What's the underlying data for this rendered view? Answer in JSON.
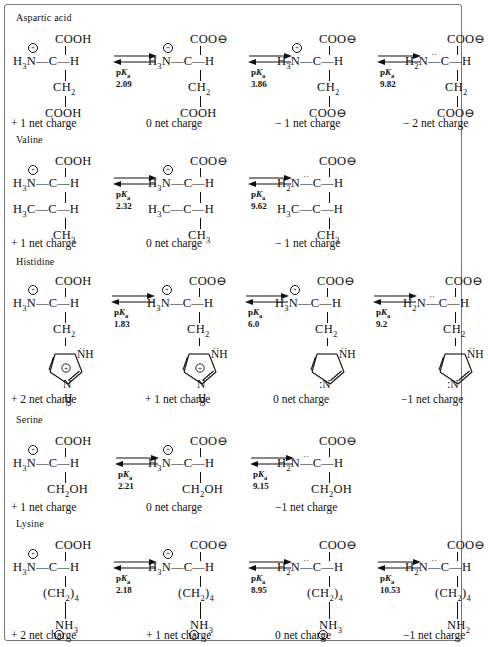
{
  "figure": {
    "type": "chemistry-diagram",
    "labels": {
      "pka_prefix": "p",
      "pka_italic": "K",
      "pka_sub": "a"
    }
  },
  "sections": [
    {
      "name": "Aspartic acid",
      "states": [
        {
          "top": "COOH",
          "amino": "H<sub>3</sub>N",
          "amino_charge": "⊕",
          "alpha": "C",
          "alpha_h": "H",
          "side1": "CH<sub>2</sub>",
          "side2": "COOH",
          "caption": "+ 1 net charge"
        },
        {
          "top": "COO⊖",
          "amino": "H<sub>3</sub>N",
          "amino_charge": "⊕",
          "alpha": "C",
          "alpha_h": "H",
          "side1": "CH<sub>2</sub>",
          "side2": "COOH",
          "caption": "0 net charge"
        },
        {
          "top": "COO⊖",
          "amino": "H<sub>3</sub>N",
          "amino_charge": "⊕",
          "alpha": "C",
          "alpha_h": "H",
          "side1": "CH<sub>2</sub>",
          "side2": "COO⊖",
          "caption": "− 1 net charge"
        },
        {
          "top": "COO⊖",
          "amino": "H<sub>2</sub>N",
          "amino_charge": "¨",
          "alpha": "C",
          "alpha_h": "H",
          "side1": "CH<sub>2</sub>",
          "side2": "COO⊖",
          "caption": "− 2 net charge"
        }
      ],
      "pka": [
        "2.09",
        "3.86",
        "9.82"
      ]
    },
    {
      "name": "Valine",
      "states": [
        {
          "top": "COOH",
          "amino": "H<sub>3</sub>N",
          "amino_charge": "⊕",
          "alpha": "C",
          "alpha_h": "H",
          "side1": "H<sub>3</sub>C—C—H",
          "side2": "CH<sub>3</sub>",
          "caption": "+ 1 net charge"
        },
        {
          "top": "COO⊖",
          "amino": "H<sub>3</sub>N",
          "amino_charge": "⊕",
          "alpha": "C",
          "alpha_h": "H",
          "side1": "H<sub>3</sub>C—C—H",
          "side2": "CH<sub>3</sub>",
          "caption": "0 net charge"
        },
        {
          "top": "COO⊖",
          "amino": "H<sub>2</sub>N",
          "amino_charge": "¨",
          "alpha": "C",
          "alpha_h": "H",
          "side1": "H<sub>3</sub>C—C—H",
          "side2": "CH<sub>3</sub>",
          "caption": "− 1 net charge"
        }
      ],
      "pka": [
        "2.32",
        "9.62"
      ]
    },
    {
      "name": "Histidine",
      "states": [
        {
          "top": "COOH",
          "amino": "H<sub>3</sub>N",
          "amino_charge": "⊕",
          "alpha": "C",
          "alpha_h": "H",
          "side1": "CH<sub>2</sub>",
          "ring": "imidazolium",
          "ring_n1": "NH",
          "ring_n3": "N",
          "ring_n3_h": "H",
          "ring_charge": "⊕",
          "caption": "+ 2 net charge"
        },
        {
          "top": "COO⊖",
          "amino": "H<sub>3</sub>N",
          "amino_charge": "⊕",
          "alpha": "C",
          "alpha_h": "H",
          "side1": "CH<sub>2</sub>",
          "ring": "imidazolium",
          "ring_n1": "NH",
          "ring_n3": "N",
          "ring_n3_h": "H",
          "ring_charge": "⊕",
          "caption": "+ 1 net charge"
        },
        {
          "top": "COO⊖",
          "amino": "H<sub>3</sub>N",
          "amino_charge": "⊕",
          "alpha": "C",
          "alpha_h": "H",
          "side1": "CH<sub>2</sub>",
          "ring": "imidazole",
          "ring_n1": "NH",
          "ring_n3": "N",
          "ring_n3_h": "",
          "ring_charge": "",
          "caption": "0 net charge"
        },
        {
          "top": "COO⊖",
          "amino": "H<sub>2</sub>N",
          "amino_charge": "¨",
          "alpha": "C",
          "alpha_h": "H",
          "side1": "CH<sub>2</sub>",
          "ring": "imidazole",
          "ring_n1": "NH",
          "ring_n3": "N",
          "ring_n3_h": "",
          "ring_charge": "",
          "caption": "−1 net charge"
        }
      ],
      "pka": [
        "1.83",
        "6.0",
        "9.2"
      ]
    },
    {
      "name": "Serine",
      "states": [
        {
          "top": "COOH",
          "amino": "H<sub>3</sub>N",
          "amino_charge": "⊕",
          "alpha": "C",
          "alpha_h": "H",
          "side1": "CH<sub>2</sub>OH",
          "side2": "",
          "caption": "+ 1 net charge"
        },
        {
          "top": "COO⊖",
          "amino": "H<sub>3</sub>N",
          "amino_charge": "⊕",
          "alpha": "C",
          "alpha_h": "H",
          "side1": "CH<sub>2</sub>OH",
          "side2": "",
          "caption": "0 net charge"
        },
        {
          "top": "COO⊖",
          "amino": "H<sub>2</sub>N",
          "amino_charge": "¨",
          "alpha": "C",
          "alpha_h": "H",
          "side1": "CH<sub>2</sub>OH",
          "side2": "",
          "caption": "−1 net charge"
        }
      ],
      "pka": [
        "2.21",
        "9.15"
      ]
    },
    {
      "name": "Lysine",
      "states": [
        {
          "top": "COOH",
          "amino": "H<sub>3</sub>N",
          "amino_charge": "⊕",
          "alpha": "C",
          "alpha_h": "H",
          "side1": "(CH<sub>2</sub>)<sub>4</sub>",
          "side2": "NH<sub>3</sub>",
          "side2_charge": "⊕",
          "caption": "+ 2 net charge"
        },
        {
          "top": "COO⊖",
          "amino": "H<sub>3</sub>N",
          "amino_charge": "⊕",
          "alpha": "C",
          "alpha_h": "H",
          "side1": "(CH<sub>2</sub>)<sub>4</sub>",
          "side2": "NH<sub>3</sub>",
          "side2_charge": "⊕",
          "caption": "+ 1 net charge"
        },
        {
          "top": "COO⊖",
          "amino": "H<sub>2</sub>N",
          "amino_charge": "¨",
          "alpha": "C",
          "alpha_h": "H",
          "side1": "(CH<sub>2</sub>)<sub>4</sub>",
          "side2": "NH<sub>3</sub>",
          "side2_charge": "⊕",
          "caption": "0 net charge"
        },
        {
          "top": "COO⊖",
          "amino": "H<sub>2</sub>N",
          "amino_charge": "¨",
          "alpha": "C",
          "alpha_h": "H",
          "side1": "(CH<sub>2</sub>)<sub>4</sub>",
          "side2": "NH<sub>2</sub>",
          "side2_charge": "¨",
          "caption": "−1 net charge"
        }
      ],
      "pka": [
        "2.18",
        "8.95",
        "10.53"
      ]
    }
  ],
  "colors": {
    "ink": "#111111",
    "border": "#777777",
    "background": "#ffffff"
  }
}
